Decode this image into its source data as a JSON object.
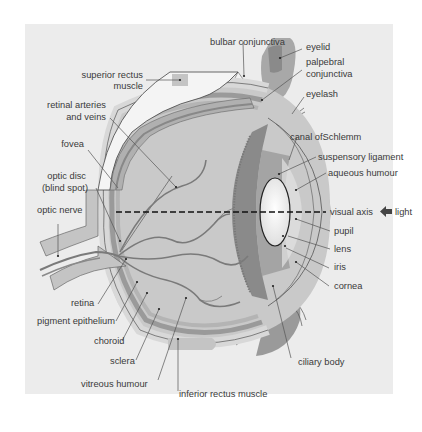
{
  "diagram": {
    "colors": {
      "background": "#ececec",
      "sclera": "#d4d4d4",
      "choroid": "#9a9a9a",
      "retina": "#bdbdbd",
      "vitreous": "#c9c9c9",
      "iris_ciliary": "#8c8c8c",
      "lens": "#ffffff",
      "vessels": "#7a7a7a",
      "label_text": "#3a3a3a"
    },
    "labels": {
      "bulbar_conjunctiva": "bulbar conjunctiva",
      "eyelid": "eyelid",
      "palpebral_conjunctiva_1": "palpebral",
      "palpebral_conjunctiva_2": "conjunctiva",
      "eyelash": "eyelash",
      "superior_rectus_1": "superior rectus",
      "superior_rectus_2": "muscle",
      "retinal_vessels_1": "retinal arteries",
      "retinal_vessels_2": "and veins",
      "fovea": "fovea",
      "optic_disc_1": "optic disc",
      "optic_disc_2": "(blind spot)",
      "optic_nerve": "optic nerve",
      "canal_of_schlemm": "canal ofSchlemm",
      "suspensory_ligament": "suspensory ligament",
      "aqueous_humour": "aqueous humour",
      "visual_axis": "visual axis",
      "light": "light",
      "pupil": "pupil",
      "lens": "lens",
      "iris": "iris",
      "cornea": "cornea",
      "retina": "retina",
      "pigment_epithelium": "pigment epithelium",
      "choroid": "choroid",
      "sclera": "sclera",
      "vitreous_humour": "vitreous humour",
      "ciliary_body": "ciliary body",
      "inferior_rectus": "inferior rectus muscle"
    },
    "icons": {
      "light_arrow": "left-arrow-icon"
    }
  }
}
